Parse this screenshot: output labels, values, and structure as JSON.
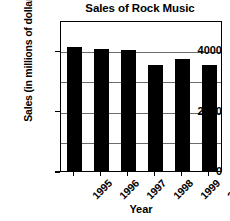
{
  "chart_data": {
    "type": "bar",
    "title": "Sales of Rock Music",
    "xlabel": "Year",
    "ylabel": "Sales (in millions of dollars)",
    "categories": [
      "1995",
      "1996",
      "1997",
      "1998",
      "1999",
      "2000"
    ],
    "values": [
      4100,
      4050,
      4000,
      3500,
      3700,
      3520
    ],
    "ylim": [
      0,
      5000
    ],
    "ytick_labels": [
      "0",
      "2000",
      "4000"
    ],
    "ytick_values": [
      0,
      2000,
      4000
    ],
    "gridline_values": [
      1000,
      2000,
      3000,
      4000
    ],
    "grid": true,
    "legend": "none",
    "bar_color": "#000000",
    "grid_color": "#6b6b6b",
    "axis_color": "#000000",
    "background_color": "#ffffff"
  }
}
